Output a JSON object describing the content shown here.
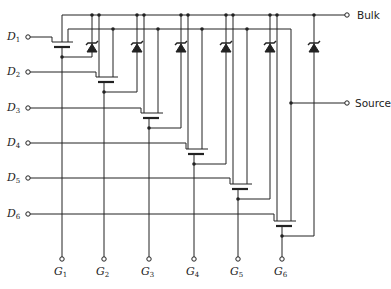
{
  "diagram": {
    "type": "circuit-schematic",
    "terminals": {
      "bulk": "Bulk",
      "source": "Source"
    },
    "drains": [
      {
        "base": "D",
        "sub": "1"
      },
      {
        "base": "D",
        "sub": "2"
      },
      {
        "base": "D",
        "sub": "3"
      },
      {
        "base": "D",
        "sub": "4"
      },
      {
        "base": "D",
        "sub": "5"
      },
      {
        "base": "D",
        "sub": "6"
      }
    ],
    "gates": [
      {
        "base": "G",
        "sub": "1"
      },
      {
        "base": "G",
        "sub": "2"
      },
      {
        "base": "G",
        "sub": "3"
      },
      {
        "base": "G",
        "sub": "4"
      },
      {
        "base": "G",
        "sub": "5"
      },
      {
        "base": "G",
        "sub": "6"
      }
    ],
    "colors": {
      "line": "#222222",
      "background": "#ffffff"
    }
  }
}
